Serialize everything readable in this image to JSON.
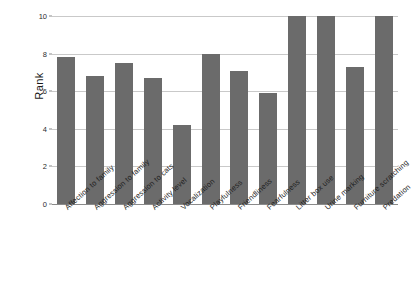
{
  "chart_data": {
    "type": "bar",
    "title": "",
    "xlabel": "",
    "ylabel": "Rank",
    "ylim": [
      0,
      10
    ],
    "yticks": [
      0,
      2,
      4,
      6,
      8,
      10
    ],
    "ytick_labels": [
      "0",
      "2",
      "4",
      "6",
      "8",
      "10"
    ],
    "grid": true,
    "legend": "none",
    "bar_color": "#6b6b6b",
    "gridline_color": "#c9c9c9",
    "axis_color": "#8a8a8a",
    "categories": [
      "Affection to family",
      "Aggression to family",
      "Aggression to cats",
      "Activity level",
      "Vocalization",
      "Playfulness",
      "Friendliness",
      "Fearfulness",
      "Litter box use",
      "Urine marking",
      "Furniture scratching",
      "Predation"
    ],
    "values": [
      7.8,
      6.8,
      7.5,
      6.7,
      4.2,
      8.0,
      7.1,
      5.9,
      10.0,
      10.0,
      7.3,
      10.0
    ]
  }
}
